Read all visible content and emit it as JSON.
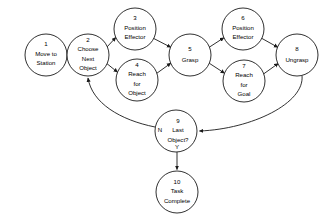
{
  "diagram": {
    "type": "flowchart",
    "nodes": [
      {
        "id": "1",
        "lines": [
          "Move to",
          "Station"
        ],
        "cx": 46,
        "cy": 55,
        "r": 21
      },
      {
        "id": "2",
        "lines": [
          "Choose",
          "Next",
          "Object"
        ],
        "cx": 88,
        "cy": 55,
        "r": 21
      },
      {
        "id": "3",
        "lines": [
          "Position",
          "Effector"
        ],
        "cx": 135,
        "cy": 29,
        "r": 21
      },
      {
        "id": "4",
        "lines": [
          "Reach",
          "for",
          "Object"
        ],
        "cx": 137,
        "cy": 80,
        "r": 21
      },
      {
        "id": "5",
        "lines": [
          "Grasp"
        ],
        "cx": 190,
        "cy": 55,
        "r": 21
      },
      {
        "id": "6",
        "lines": [
          "Position",
          "Effector"
        ],
        "cx": 243,
        "cy": 29,
        "r": 21
      },
      {
        "id": "7",
        "lines": [
          "Reach",
          "for",
          "Goal"
        ],
        "cx": 244,
        "cy": 81,
        "r": 21
      },
      {
        "id": "8",
        "lines": [
          "Ungrasp"
        ],
        "cx": 297,
        "cy": 55,
        "r": 21
      },
      {
        "id": "9",
        "lines": [
          "Last",
          "Object?"
        ],
        "cx": 176,
        "cy": 131,
        "r": 21
      },
      {
        "id": "10",
        "lines": [
          "Task",
          "Complete"
        ],
        "cx": 177,
        "cy": 192,
        "r": 21
      }
    ],
    "branch_labels": [
      {
        "text": "N",
        "x": 160,
        "y": 130
      },
      {
        "text": "Y",
        "x": 177,
        "y": 147
      }
    ],
    "edges": [
      {
        "from": "1",
        "to": "2",
        "shape": "straight"
      },
      {
        "from": "2",
        "to": "3",
        "shape": "straight"
      },
      {
        "from": "2",
        "to": "4",
        "shape": "straight"
      },
      {
        "from": "3",
        "to": "5",
        "shape": "straight"
      },
      {
        "from": "4",
        "to": "5",
        "shape": "straight"
      },
      {
        "from": "5",
        "to": "6",
        "shape": "straight"
      },
      {
        "from": "5",
        "to": "7",
        "shape": "straight"
      },
      {
        "from": "6",
        "to": "8",
        "shape": "straight"
      },
      {
        "from": "7",
        "to": "8",
        "shape": "straight"
      },
      {
        "from": "8",
        "to": "9",
        "shape": "curve",
        "label": ""
      },
      {
        "from": "9",
        "to": "2",
        "shape": "curve",
        "label": "N"
      },
      {
        "from": "9",
        "to": "10",
        "shape": "straight",
        "label": "Y"
      }
    ],
    "colors": {
      "stroke": "#1a1a1a",
      "fill": "#ffffff",
      "text": "#000000",
      "background": "#ffffff"
    }
  }
}
